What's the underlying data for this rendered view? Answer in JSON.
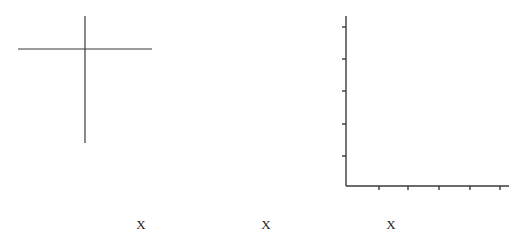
{
  "colors": {
    "background": "#ffffff",
    "stroke": "#3a3a3a",
    "text": "#222222"
  },
  "cross": {
    "horizontal": {
      "x1": 18,
      "x2": 152,
      "y": 49
    },
    "vertical": {
      "x": 85,
      "y1": 16,
      "y2": 143
    }
  },
  "axes": {
    "origin": {
      "x": 346,
      "y": 186
    },
    "y_axis_top": 16,
    "x_axis_right": 509,
    "y_ticks": [
      27,
      59,
      91,
      124,
      156
    ],
    "x_ticks": [
      379,
      408,
      439,
      470,
      500
    ],
    "tick_length": 4
  },
  "labels": [
    {
      "text": "X",
      "x": 141
    },
    {
      "text": "X",
      "x": 266
    },
    {
      "text": "X",
      "x": 391
    }
  ]
}
